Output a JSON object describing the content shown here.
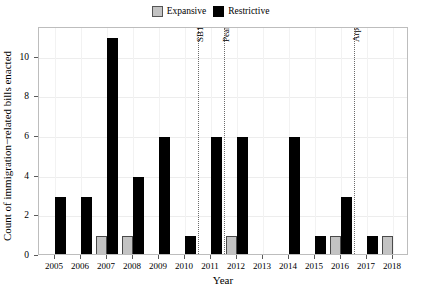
{
  "legend": {
    "position": "top-center",
    "entries": [
      {
        "label": "Expansive",
        "color": "#c3c3c3",
        "swatch_name": "legend-swatch-expansive"
      },
      {
        "label": "Restrictive",
        "color": "#000000",
        "swatch_name": "legend-swatch-restrictive"
      }
    ]
  },
  "axes": {
    "xlabel": "Year",
    "ylabel": "Count of immigration−related bills enacted",
    "yticks": [
      "0",
      "2",
      "4",
      "6",
      "8",
      "10"
    ],
    "xticks": [
      "2005",
      "2006",
      "2007",
      "2008",
      "2009",
      "2010",
      "2011",
      "2012",
      "2013",
      "2014",
      "2015",
      "2016",
      "2017",
      "2018"
    ]
  },
  "annotations": [
    {
      "label": "SB1070",
      "x": 2010.5
    },
    {
      "label": "Pearce Recall",
      "x": 2011.5
    },
    {
      "label": "Arpaio Ousted",
      "x": 2016.5
    }
  ],
  "chart_data": {
    "type": "bar",
    "title": "",
    "xlabel": "Year",
    "ylabel": "Count of immigration−related bills enacted",
    "categories": [
      2005,
      2006,
      2007,
      2008,
      2009,
      2010,
      2011,
      2012,
      2013,
      2014,
      2015,
      2016,
      2017,
      2018
    ],
    "series": [
      {
        "name": "Expansive",
        "color": "#c3c3c3",
        "values": [
          0,
          0,
          1,
          1,
          0,
          0,
          0,
          1,
          0,
          0,
          0,
          1,
          0,
          1
        ]
      },
      {
        "name": "Restrictive",
        "color": "#000000",
        "values": [
          3,
          3,
          11,
          4,
          6,
          1,
          6,
          6,
          0,
          6,
          1,
          3,
          1,
          0
        ]
      }
    ],
    "ylim": [
      0,
      11.5
    ],
    "xlim": [
      2004.4,
      2018.6
    ],
    "ytick_values": [
      0,
      2,
      4,
      6,
      8,
      10
    ],
    "grid": true,
    "legend_position": "top-center",
    "annotations": [
      {
        "label": "SB1070",
        "x": 2010.5,
        "style": "dotted-vline"
      },
      {
        "label": "Pearce Recall",
        "x": 2011.5,
        "style": "dotted-vline"
      },
      {
        "label": "Arpaio Ousted",
        "x": 2016.5,
        "style": "dotted-vline"
      }
    ]
  }
}
